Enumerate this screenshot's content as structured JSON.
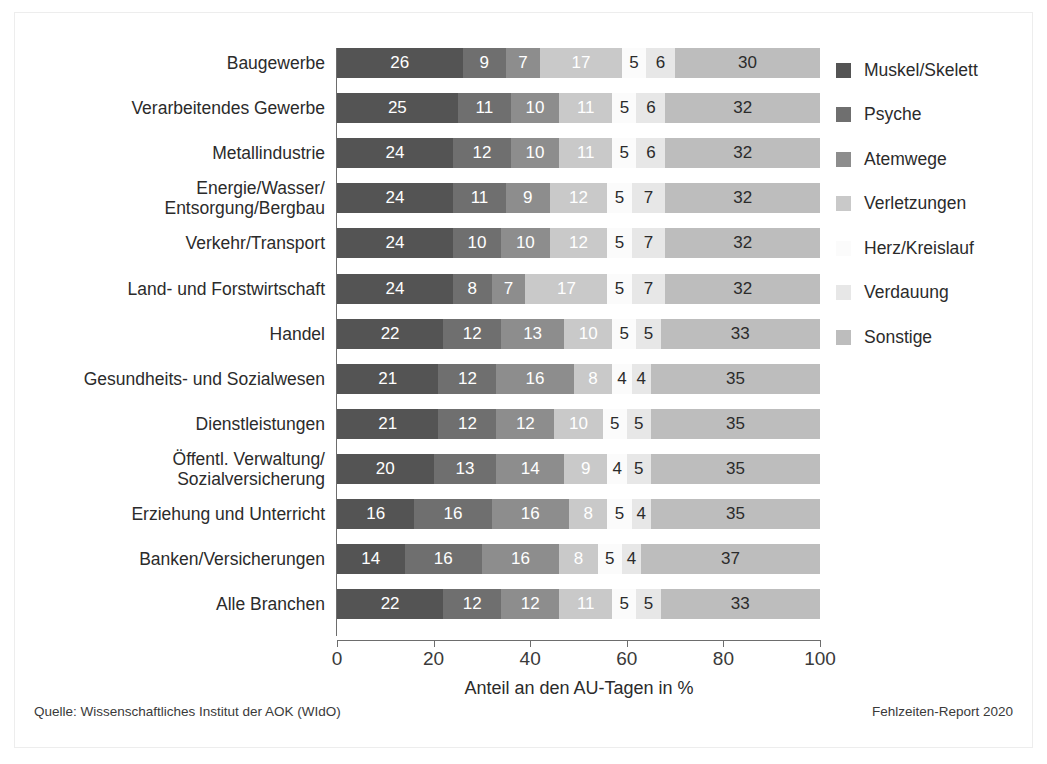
{
  "chart_data": {
    "type": "bar",
    "subtype": "stacked-horizontal-100pct",
    "title": "",
    "xlabel": "Anteil an den AU-Tagen in %",
    "ylabel": "",
    "xlim": [
      0,
      100
    ],
    "xticks": [
      "0",
      "20",
      "40",
      "60",
      "80",
      "100"
    ],
    "grid": false,
    "legend_position": "right",
    "categories": [
      "Baugewerbe",
      "Verarbeitendes Gewerbe",
      "Metallindustrie",
      "Energie/Wasser/\nEntsorgung/Bergbau",
      "Verkehr/Transport",
      "Land- und Forstwirtschaft",
      "Handel",
      "Gesundheits- und Sozialwesen",
      "Dienstleistungen",
      "Öffentl. Verwaltung/\nSozialversicherung",
      "Erziehung und Unterricht",
      "Banken/Versicherungen",
      "Alle Branchen"
    ],
    "series": [
      {
        "name": "Muskel/Skelett",
        "color": "#545454",
        "label_color": "#ffffff",
        "values": [
          26,
          25,
          24,
          24,
          24,
          24,
          22,
          21,
          21,
          20,
          16,
          14,
          22
        ]
      },
      {
        "name": "Psyche",
        "color": "#6f6f6f",
        "label_color": "#ffffff",
        "values": [
          9,
          11,
          12,
          11,
          10,
          8,
          12,
          12,
          12,
          13,
          16,
          16,
          12
        ]
      },
      {
        "name": "Atemwege",
        "color": "#8d8d8d",
        "label_color": "#ffffff",
        "values": [
          7,
          10,
          10,
          9,
          10,
          7,
          13,
          16,
          12,
          14,
          16,
          16,
          12
        ]
      },
      {
        "name": "Verletzungen",
        "color": "#c9c9c9",
        "label_color": "#ffffff",
        "values": [
          17,
          11,
          11,
          12,
          12,
          17,
          10,
          8,
          10,
          9,
          8,
          8,
          11
        ]
      },
      {
        "name": "Herz/Kreislauf",
        "color": "#fbfbfb",
        "label_color": "#2b2b2b",
        "values": [
          5,
          5,
          5,
          5,
          5,
          5,
          5,
          4,
          5,
          4,
          5,
          5,
          5
        ]
      },
      {
        "name": "Verdauung",
        "color": "#e7e7e7",
        "label_color": "#2b2b2b",
        "values": [
          6,
          6,
          6,
          7,
          7,
          7,
          5,
          4,
          5,
          5,
          4,
          4,
          5
        ]
      },
      {
        "name": "Sonstige",
        "color": "#bdbdbd",
        "label_color": "#2b2b2b",
        "values": [
          30,
          32,
          32,
          32,
          32,
          32,
          33,
          35,
          35,
          35,
          35,
          37,
          33
        ]
      }
    ]
  },
  "footer": {
    "source": "Quelle: Wissenschaftliches Institut der AOK (WIdO)",
    "report": "Fehlzeiten-Report 2020"
  }
}
